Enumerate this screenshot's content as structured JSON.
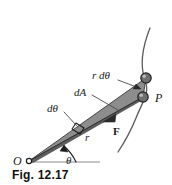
{
  "figure": {
    "caption": "Fig. 12.17",
    "background_color": "#ffffff",
    "ink_color": "#1a1a1a",
    "wedge_fill_color": "#8d8d8d",
    "wedge_shadow_color": "#5d5d5d",
    "node_fill_color": "#6e6e6e",
    "node_stroke_color": "#232323"
  },
  "labels": {
    "r_dtheta": "r dθ",
    "dA": "dA",
    "dtheta": "dθ",
    "point_p": "P",
    "radius": "r",
    "force": "F",
    "theta": "θ",
    "origin": "O"
  },
  "icons": {
    "origin_pin": "origin-pin-icon",
    "node_upper": "orbit-node-icon",
    "node_lower": "orbit-node-p-icon",
    "right_angle": "right-angle-marker-icon",
    "force_arrow": "force-arrowhead-icon",
    "theta_arc_arrow": "angle-arc-arrowhead-icon",
    "leader_rdtheta": "leader-line-arrow-icon",
    "trajectory": "trajectory-arc-icon"
  }
}
